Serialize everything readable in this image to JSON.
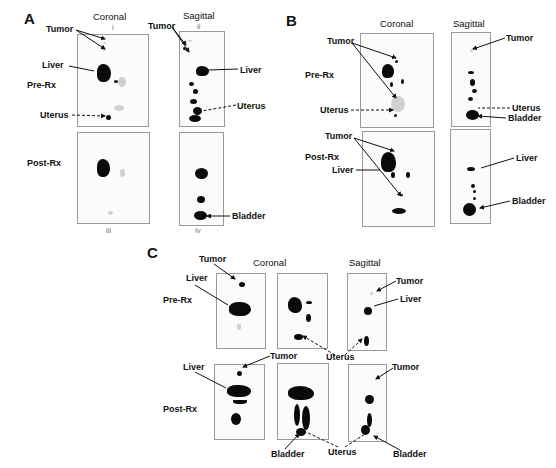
{
  "figure": {
    "panels": [
      {
        "letter": "A",
        "columns": [
          "Coronal",
          "Sagittal"
        ],
        "roman_top": [
          "i",
          "ii"
        ],
        "roman_bottom": [
          "iii",
          "iv"
        ],
        "rows": [
          "Pre-Rx",
          "Post-Rx"
        ],
        "annotations": {
          "tumor_coronal": "Tumor",
          "tumor_sagittal": "Tumor",
          "liver_coronal": "Liver",
          "liver_sagittal": "Liver",
          "uterus_coronal": "Uterus",
          "uterus_sagittal": "Uterus",
          "bladder_sagittal_post": "Bladder"
        }
      },
      {
        "letter": "B",
        "columns": [
          "Coronal",
          "Sagittal"
        ],
        "rows": [
          "Pre-Rx",
          "Post-Rx"
        ],
        "annotations": {
          "tumor_coronal_pre": "Tumor",
          "uterus_coronal_pre": "Uterus",
          "tumor_sagittal_pre": "Tumor",
          "uterus_sagittal_pre": "Uterus",
          "bladder_sagittal_pre": "Bladder",
          "tumor_coronal_post": "Tumor",
          "liver_coronal_post": "Liver",
          "liver_sagittal_post": "Liver",
          "bladder_sagittal_post": "Bladder"
        }
      },
      {
        "letter": "C",
        "columns": [
          "Coronal",
          "Sagittal"
        ],
        "rows": [
          "Pre-Rx",
          "Post-Rx"
        ],
        "annotations": {
          "tumor_pre": "Tumor",
          "liver_pre": "Liver",
          "tumor_sagittal_pre": "Tumor",
          "liver_sagittal_pre": "Liver",
          "uterus_mid": "Uterus",
          "tumor_post": "Tumor",
          "liver_post": "Liver",
          "tumor_sagittal_post": "Tumor",
          "bladder_coronal_post": "Bladder",
          "uterus_bottom": "Uterus",
          "bladder_sagittal_post": "Bladder"
        }
      }
    ]
  }
}
